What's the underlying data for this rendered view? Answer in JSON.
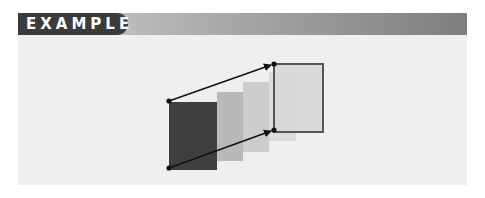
{
  "header": {
    "label": "EXAMPLE",
    "tab_color": "#3b3b3b",
    "bar_gradient": [
      "#d2d2d2",
      "#7e7e7e"
    ]
  },
  "diagram": {
    "source_rect": {
      "x": 169,
      "y": 102,
      "w": 48,
      "h": 68,
      "color": "#3f3f3f"
    },
    "intermediate_rects": [
      {
        "x": 217,
        "y": 92,
        "w": 26,
        "h": 69,
        "color": "#b9b9b9"
      },
      {
        "x": 243,
        "y": 82,
        "w": 26,
        "h": 70,
        "color": "#cdcdcd"
      },
      {
        "x": 269,
        "y": 72,
        "w": 27,
        "h": 69,
        "color": "#dcdcdc"
      }
    ],
    "target_rect": {
      "x": 274,
      "y": 64,
      "w": 49,
      "h": 68,
      "fill": "#d6d6d6",
      "stroke": "#555555"
    },
    "arrows": [
      {
        "from": [
          169,
          101
        ],
        "to": [
          274,
          64
        ]
      },
      {
        "from": [
          169,
          168
        ],
        "to": [
          274,
          130
        ]
      }
    ],
    "dot_color": "#111111"
  }
}
